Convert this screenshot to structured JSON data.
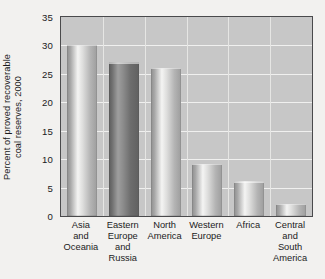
{
  "chart_data": {
    "type": "bar",
    "title": "",
    "subtitle": "",
    "xlabel": "",
    "ylabel": "Percent of proved recoverable coal reserves, 2000",
    "ylabel_lines": [
      "Percent of proved recoverable",
      "coal reserves, 2000"
    ],
    "categories": [
      "Asia and Oceania",
      "Eastern Europe and Russia",
      "North America",
      "Western Europe",
      "Africa",
      "Central and South America"
    ],
    "category_lines": [
      [
        "Asia",
        "and",
        "Oceania"
      ],
      [
        "Eastern",
        "Europe",
        "and",
        "Russia"
      ],
      [
        "North",
        "America"
      ],
      [
        "Western",
        "Europe"
      ],
      [
        "Africa"
      ],
      [
        "Central",
        "and",
        "South",
        "America"
      ]
    ],
    "values": [
      30.1,
      27.1,
      26.1,
      9.2,
      6.1,
      2.2
    ],
    "ylim": [
      0,
      35
    ],
    "yticks": [
      0,
      5,
      10,
      15,
      20,
      25,
      30,
      35
    ],
    "ytick_labels": [
      "0",
      "5",
      "10",
      "15",
      "20",
      "25",
      "30",
      "35"
    ],
    "grid": {
      "horizontal": true,
      "vertical": true
    },
    "legend": {
      "visible": false,
      "position": "none"
    },
    "colors": {
      "plot_background": "#c7c7c7",
      "page_background": "#f2f1ef",
      "gridline": "#f0f0ef",
      "axis_border": "#4a4a4c",
      "bar_light": "#bdbdbd",
      "bar_dark": "#707070",
      "text": "#1b1b1c"
    },
    "bar_styles": [
      "light",
      "dark",
      "light",
      "light",
      "light",
      "light"
    ]
  }
}
